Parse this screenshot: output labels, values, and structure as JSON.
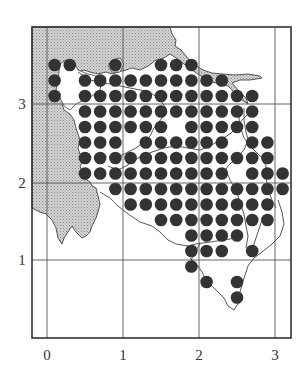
{
  "map": {
    "frame": {
      "x0": 32,
      "y0": 27,
      "x1": 291,
      "y1": 338
    },
    "grid": {
      "x_lines": [
        47,
        123,
        199,
        275
      ],
      "y_lines": [
        104,
        183,
        260
      ],
      "x_labels": [
        "0",
        "1",
        "2",
        "3"
      ],
      "y_labels": [
        "3",
        "2",
        "1"
      ]
    },
    "colors": {
      "sea": "#c8c8c8",
      "land": "#ffffff",
      "dot": "#333333",
      "lines": "#444444"
    },
    "dot_grid": {
      "x_start": 54.6,
      "x_step": 15.2,
      "y_start": 65,
      "y_step": 15.5,
      "radius": 6.3,
      "rows": [
        [
          0,
          1,
          4,
          7,
          8,
          9
        ],
        [
          0,
          2,
          3,
          4,
          5,
          6,
          7,
          8,
          9,
          10,
          11
        ],
        [
          0,
          2,
          3,
          4,
          5,
          6,
          7,
          8,
          9,
          10,
          11,
          12,
          13
        ],
        [
          2,
          3,
          4,
          5,
          6,
          7,
          8,
          9,
          10,
          11,
          12,
          13
        ],
        [
          2,
          3,
          4,
          5,
          6,
          7,
          9,
          10,
          11,
          12,
          13
        ],
        [
          2,
          3,
          4,
          6,
          7,
          8,
          9,
          10,
          11,
          13,
          14
        ],
        [
          2,
          3,
          4,
          5,
          6,
          7,
          8,
          9,
          10,
          11,
          12,
          13,
          14
        ],
        [
          2,
          3,
          4,
          5,
          6,
          7,
          8,
          9,
          10,
          11,
          13,
          14,
          15
        ],
        [
          4,
          5,
          6,
          7,
          8,
          9,
          10,
          11,
          12,
          13,
          14,
          15
        ],
        [
          5,
          6,
          7,
          8,
          9,
          10,
          11,
          12,
          13,
          14
        ],
        [
          7,
          8,
          9,
          10,
          11,
          12,
          13,
          14
        ],
        [
          9,
          10,
          11,
          12
        ],
        [
          9,
          10,
          11,
          13
        ],
        [
          9
        ],
        [
          10,
          12
        ],
        [
          12
        ]
      ]
    }
  }
}
